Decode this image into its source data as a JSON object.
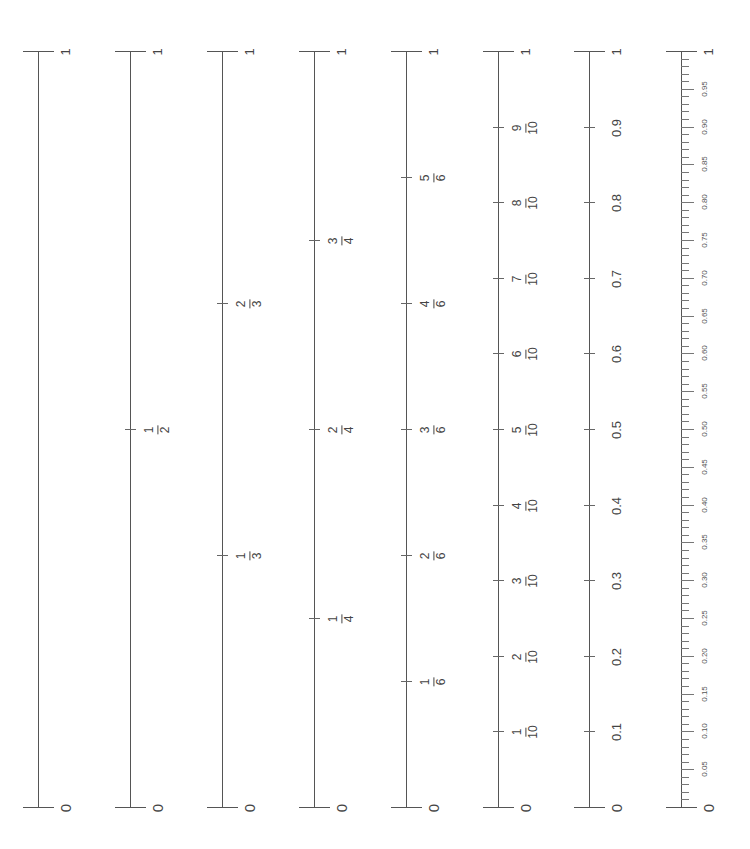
{
  "layout": {
    "top_y": 51,
    "bottom_y": 807,
    "line_color": "#555555"
  },
  "rulers": [
    {
      "name": "ruler-whole",
      "x": 38,
      "divisions": 1,
      "labels": []
    },
    {
      "name": "ruler-halves",
      "x": 130,
      "divisions": 2,
      "labels": [
        {
          "num": "1",
          "den": "2",
          "value": 0.5
        }
      ]
    },
    {
      "name": "ruler-thirds",
      "x": 222,
      "divisions": 3,
      "labels": [
        {
          "num": "1",
          "den": "3",
          "value": 0.3333
        },
        {
          "num": "2",
          "den": "3",
          "value": 0.6667
        }
      ]
    },
    {
      "name": "ruler-quarters",
      "x": 314,
      "divisions": 4,
      "labels": [
        {
          "num": "1",
          "den": "4",
          "value": 0.25
        },
        {
          "num": "2",
          "den": "4",
          "value": 0.5
        },
        {
          "num": "3",
          "den": "4",
          "value": 0.75
        }
      ]
    },
    {
      "name": "ruler-sixths",
      "x": 406,
      "divisions": 6,
      "labels": [
        {
          "num": "1",
          "den": "6",
          "value": 0.1667
        },
        {
          "num": "2",
          "den": "6",
          "value": 0.3333
        },
        {
          "num": "3",
          "den": "6",
          "value": 0.5
        },
        {
          "num": "4",
          "den": "6",
          "value": 0.6667
        },
        {
          "num": "5",
          "den": "6",
          "value": 0.8333
        }
      ]
    },
    {
      "name": "ruler-tenths-fraction",
      "x": 498,
      "divisions": 10,
      "labels": [
        {
          "num": "1",
          "den": "10",
          "value": 0.1
        },
        {
          "num": "2",
          "den": "10",
          "value": 0.2
        },
        {
          "num": "3",
          "den": "10",
          "value": 0.3
        },
        {
          "num": "4",
          "den": "10",
          "value": 0.4
        },
        {
          "num": "5",
          "den": "10",
          "value": 0.5
        },
        {
          "num": "6",
          "den": "10",
          "value": 0.6
        },
        {
          "num": "7",
          "den": "10",
          "value": 0.7
        },
        {
          "num": "8",
          "den": "10",
          "value": 0.8
        },
        {
          "num": "9",
          "den": "10",
          "value": 0.9
        }
      ]
    },
    {
      "name": "ruler-tenths-decimal",
      "x": 589,
      "divisions": 10,
      "labels": [
        {
          "text": "0.1",
          "value": 0.1
        },
        {
          "text": "0.2",
          "value": 0.2
        },
        {
          "text": "0.3",
          "value": 0.3
        },
        {
          "text": "0.4",
          "value": 0.4
        },
        {
          "text": "0.5",
          "value": 0.5
        },
        {
          "text": "0.6",
          "value": 0.6
        },
        {
          "text": "0.7",
          "value": 0.7
        },
        {
          "text": "0.8",
          "value": 0.8
        },
        {
          "text": "0.9",
          "value": 0.9
        }
      ]
    },
    {
      "name": "ruler-hundredths",
      "x": 681,
      "divisions": 100,
      "minor": true,
      "labels": [
        {
          "text": "0.05",
          "value": 0.05
        },
        {
          "text": "0.10",
          "value": 0.1
        },
        {
          "text": "0.15",
          "value": 0.15
        },
        {
          "text": "0.20",
          "value": 0.2
        },
        {
          "text": "0.25",
          "value": 0.25
        },
        {
          "text": "0.30",
          "value": 0.3
        },
        {
          "text": "0.35",
          "value": 0.35
        },
        {
          "text": "0.40",
          "value": 0.4
        },
        {
          "text": "0.45",
          "value": 0.45
        },
        {
          "text": "0.50",
          "value": 0.5
        },
        {
          "text": "0.55",
          "value": 0.55
        },
        {
          "text": "0.60",
          "value": 0.6
        },
        {
          "text": "0.65",
          "value": 0.65
        },
        {
          "text": "0.70",
          "value": 0.7
        },
        {
          "text": "0.75",
          "value": 0.75
        },
        {
          "text": "0.80",
          "value": 0.8
        },
        {
          "text": "0.85",
          "value": 0.85
        },
        {
          "text": "0.90",
          "value": 0.9
        },
        {
          "text": "0.95",
          "value": 0.95
        }
      ]
    }
  ],
  "end_labels": {
    "top": "1",
    "bottom": "0"
  }
}
